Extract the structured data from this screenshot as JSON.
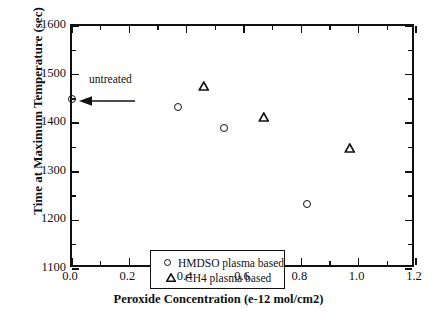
{
  "chart_data": {
    "type": "scatter",
    "title": "",
    "xlabel": "Peroxide Concentration (e-12 mol/cm2)",
    "ylabel": "Time at Maximum Temperature (sec)",
    "xlim": [
      0.0,
      1.2
    ],
    "ylim": [
      1100,
      1600
    ],
    "xticks": [
      "0.0",
      "0.2",
      "0.4",
      "0.6",
      "0.8",
      "1.0",
      "1.2"
    ],
    "xtick_values": [
      0.0,
      0.2,
      0.4,
      0.6,
      0.8,
      1.0,
      1.2
    ],
    "xminor_values": [
      0.1,
      0.3,
      0.5,
      0.7,
      0.9,
      1.1
    ],
    "yticks": [
      "1100",
      "1200",
      "1300",
      "1400",
      "1500",
      "1600"
    ],
    "ytick_values": [
      1100,
      1200,
      1300,
      1400,
      1500,
      1600
    ],
    "yminor_values": [
      1150,
      1250,
      1350,
      1450,
      1550
    ],
    "grid": false,
    "legend_position": "lower left",
    "series": [
      {
        "name": "HMDSO plasma based",
        "marker": "circle",
        "points": [
          {
            "x": 0.0,
            "y": 1450
          },
          {
            "x": 0.37,
            "y": 1433
          },
          {
            "x": 0.53,
            "y": 1391
          },
          {
            "x": 0.82,
            "y": 1233
          }
        ]
      },
      {
        "name": "CH4 plasma based",
        "marker": "triangle",
        "points": [
          {
            "x": 0.47,
            "y": 1477
          },
          {
            "x": 0.68,
            "y": 1413
          },
          {
            "x": 0.98,
            "y": 1348
          }
        ]
      }
    ],
    "annotations": [
      {
        "text": "untreated",
        "x": 0.0,
        "y": 1450
      }
    ]
  },
  "colors": {
    "axis": "#111111",
    "marker": "#111111",
    "background": "#ffffff"
  }
}
